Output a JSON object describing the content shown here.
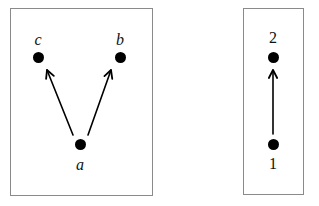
{
  "figure": {
    "background_color": "#ffffff",
    "ink_color": "#000000",
    "panel_border_color": "#8a8a8a"
  },
  "panels": [
    {
      "id": "left",
      "nodes": [
        {
          "id": "c",
          "label": "c",
          "label_style": "italic",
          "label_position": "above",
          "x": 38,
          "y": 57,
          "label_x": 38,
          "label_y": 32
        },
        {
          "id": "b",
          "label": "b",
          "label_style": "italic",
          "label_position": "above",
          "x": 120,
          "y": 57,
          "label_x": 120,
          "label_y": 32
        },
        {
          "id": "a",
          "label": "a",
          "label_style": "italic",
          "label_position": "below",
          "x": 80,
          "y": 144,
          "label_x": 80,
          "label_y": 157
        }
      ],
      "edges": [
        {
          "from": "a",
          "to": "c",
          "x1": 73,
          "y1": 135,
          "x2": 47,
          "y2": 70,
          "arrow": "to"
        },
        {
          "from": "a",
          "to": "b",
          "x1": 88,
          "y1": 135,
          "x2": 111,
          "y2": 70,
          "arrow": "to"
        }
      ]
    },
    {
      "id": "right",
      "nodes": [
        {
          "id": "2",
          "label": "2",
          "label_style": "upright",
          "label_position": "above",
          "x": 273,
          "y": 57,
          "label_x": 273,
          "label_y": 30
        },
        {
          "id": "1",
          "label": "1",
          "label_style": "upright",
          "label_position": "below",
          "x": 273,
          "y": 144,
          "label_x": 273,
          "label_y": 156
        }
      ],
      "edges": [
        {
          "from": "1",
          "to": "2",
          "x1": 273,
          "y1": 134,
          "x2": 273,
          "y2": 70,
          "arrow": "to"
        }
      ]
    }
  ]
}
